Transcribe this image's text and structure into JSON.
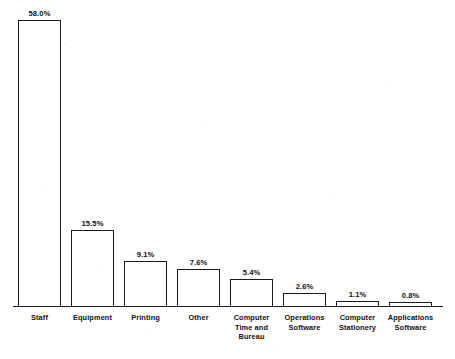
{
  "chart_data": {
    "type": "bar",
    "title": "",
    "xlabel": "",
    "ylabel": "",
    "ylim": [
      0,
      58.0
    ],
    "grid": false,
    "legend": "none",
    "orientation": "vertical",
    "bar_style": "white fill with black outline",
    "categories": [
      "Staff",
      "Equipment",
      "Printing",
      "Other",
      "Computer Time and Bureau",
      "Operations Software",
      "Computer Stationery",
      "Applications Software"
    ],
    "category_lines": [
      [
        "Staff"
      ],
      [
        "Equipment"
      ],
      [
        "Printing"
      ],
      [
        "Other"
      ],
      [
        "Computer",
        "Time and",
        "Bureau"
      ],
      [
        "Operations",
        "Software"
      ],
      [
        "Computer",
        "Stationery"
      ],
      [
        "Applications",
        "Software"
      ]
    ],
    "values": [
      58.0,
      15.5,
      9.1,
      7.6,
      5.4,
      2.6,
      1.1,
      0.8
    ],
    "value_labels": [
      "58.0%",
      "15.5%",
      "9.1%",
      "7.6%",
      "5.4%",
      "2.6%",
      "1.1%",
      "0.8%"
    ],
    "units": "percent",
    "total": "100.1%"
  },
  "colors": {
    "bar_outline": "#1a1a1a",
    "bar_fill": "#ffffff",
    "axis": "#1a1a1a",
    "text": "#111111",
    "background": "#ffffff"
  },
  "geometry": {
    "baseline_y": 306,
    "axis_left_x": 13,
    "axis_right_x": 443,
    "bar_width": 43,
    "bar_pitch": 53,
    "first_bar_left": 18,
    "px_per_percent": 4.93,
    "value_label_offset": 11,
    "category_label_top": 313
  }
}
